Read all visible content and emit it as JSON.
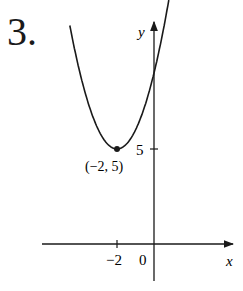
{
  "problem_number": "3.",
  "chart_data": {
    "type": "line",
    "title": "",
    "xlabel": "x",
    "ylabel": "y",
    "x_ticks": [
      {
        "value": -2,
        "label": "−2"
      }
    ],
    "y_ticks": [
      {
        "value": 5,
        "label": "5"
      }
    ],
    "origin_label": "0",
    "grid": false,
    "legend": null,
    "annotations": [
      {
        "x": -2,
        "y": 5,
        "label": "(−2, 5)",
        "marker": "dot"
      }
    ],
    "series": [
      {
        "name": "parabola",
        "equation": "y = (x+2)^2 + 5",
        "x": [
          -4.5,
          -4,
          -3.5,
          -3,
          -2.5,
          -2,
          -1.5,
          -1,
          -0.5,
          0,
          0.5,
          0.8
        ],
        "y": [
          11.25,
          9,
          7.25,
          6,
          5.25,
          5,
          5.25,
          6,
          7.25,
          9,
          11.25,
          12.84
        ]
      }
    ]
  }
}
